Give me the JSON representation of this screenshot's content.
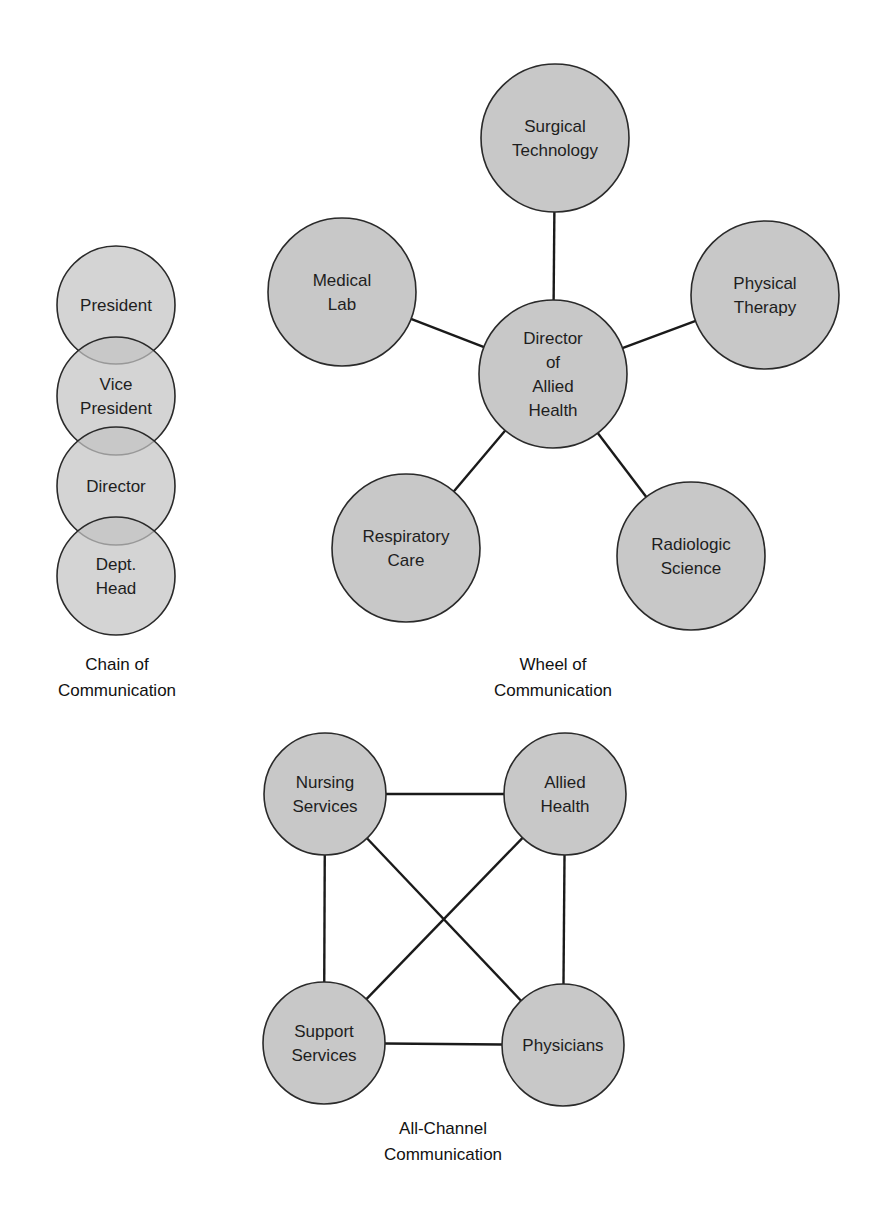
{
  "colors": {
    "background": "#ffffff",
    "node_fill": "#c8c8c8",
    "node_stroke": "#2a2a2a",
    "edge": "#1a1a1a",
    "text": "#1e1e1e"
  },
  "chain": {
    "caption": [
      "Chain of",
      "Communication"
    ],
    "caption_pos": {
      "x": 117,
      "y": 670
    },
    "nodes": [
      {
        "id": "president",
        "lines": [
          "President"
        ],
        "cx": 116,
        "cy": 305,
        "r": 59
      },
      {
        "id": "vice-president",
        "lines": [
          "Vice",
          "President"
        ],
        "cx": 116,
        "cy": 396,
        "r": 59
      },
      {
        "id": "director",
        "lines": [
          "Director"
        ],
        "cx": 116,
        "cy": 486,
        "r": 59
      },
      {
        "id": "dept-head",
        "lines": [
          "Dept.",
          "Head"
        ],
        "cx": 116,
        "cy": 576,
        "r": 59
      }
    ]
  },
  "wheel": {
    "caption": [
      "Wheel of",
      "Communication"
    ],
    "caption_pos": {
      "x": 553,
      "y": 670
    },
    "hub": {
      "id": "director-of-allied-health",
      "lines": [
        "Director",
        "of",
        "Allied",
        "Health"
      ],
      "cx": 553,
      "cy": 374,
      "r": 74
    },
    "spokes": [
      {
        "id": "surgical-technology",
        "lines": [
          "Surgical",
          "Technology"
        ],
        "cx": 555,
        "cy": 138,
        "r": 74
      },
      {
        "id": "medical-lab",
        "lines": [
          "Medical",
          "Lab"
        ],
        "cx": 342,
        "cy": 292,
        "r": 74
      },
      {
        "id": "physical-therapy",
        "lines": [
          "Physical",
          "Therapy"
        ],
        "cx": 765,
        "cy": 295,
        "r": 74
      },
      {
        "id": "respiratory-care",
        "lines": [
          "Respiratory",
          "Care"
        ],
        "cx": 406,
        "cy": 548,
        "r": 74
      },
      {
        "id": "radiologic-science",
        "lines": [
          "Radiologic",
          "Science"
        ],
        "cx": 691,
        "cy": 556,
        "r": 74
      }
    ]
  },
  "all_channel": {
    "caption": [
      "All-Channel",
      "Communication"
    ],
    "caption_pos": {
      "x": 443,
      "y": 1134
    },
    "nodes": [
      {
        "id": "nursing-services",
        "lines": [
          "Nursing",
          "Services"
        ],
        "cx": 325,
        "cy": 794,
        "r": 61
      },
      {
        "id": "allied-health",
        "lines": [
          "Allied",
          "Health"
        ],
        "cx": 565,
        "cy": 794,
        "r": 61
      },
      {
        "id": "support-services",
        "lines": [
          "Support",
          "Services"
        ],
        "cx": 324,
        "cy": 1043,
        "r": 61
      },
      {
        "id": "physicians",
        "lines": [
          "Physicians"
        ],
        "cx": 563,
        "cy": 1045,
        "r": 61
      }
    ],
    "edges": [
      [
        "nursing-services",
        "allied-health"
      ],
      [
        "nursing-services",
        "support-services"
      ],
      [
        "nursing-services",
        "physicians"
      ],
      [
        "allied-health",
        "support-services"
      ],
      [
        "allied-health",
        "physicians"
      ],
      [
        "support-services",
        "physicians"
      ]
    ]
  }
}
